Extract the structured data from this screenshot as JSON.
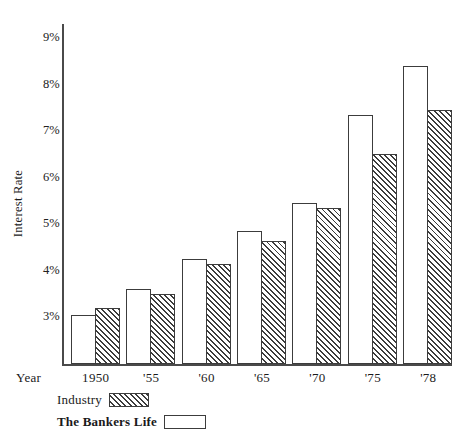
{
  "chart_data": {
    "type": "bar",
    "title": "",
    "subtitle": "",
    "xlabel": "Year",
    "ylabel": "Interest Rate",
    "categories": [
      "1950",
      "'55",
      "'60",
      "'65",
      "'70",
      "'75",
      "'78"
    ],
    "series": [
      {
        "name": "The Bankers Life",
        "style": "open",
        "values": [
          3.05,
          3.6,
          4.25,
          4.85,
          5.45,
          7.35,
          8.4
        ]
      },
      {
        "name": "Industry",
        "style": "hatched",
        "values": [
          3.2,
          3.5,
          4.15,
          4.65,
          5.35,
          6.5,
          7.45
        ]
      }
    ],
    "ylim": [
      2.0,
      9.3
    ],
    "y_ticks": [
      {
        "value": 9,
        "label": "9%"
      },
      {
        "value": 8,
        "label": "8%"
      },
      {
        "value": 7,
        "label": "7%"
      },
      {
        "value": 6,
        "label": "6%"
      },
      {
        "value": 5,
        "label": "5%"
      },
      {
        "value": 4,
        "label": "4%"
      },
      {
        "value": 3,
        "label": "3%"
      }
    ],
    "grid": false,
    "legend_position": "bottom-left",
    "legend": [
      {
        "label": "Industry",
        "swatch": "hatched"
      },
      {
        "label": "The Bankers Life",
        "swatch": "open"
      }
    ],
    "colors": {
      "axis": "#4a4a4a",
      "bar_outline": "#3c3c3c",
      "bar_fill_open": "#ffffff",
      "hatch": "#3c3c3c",
      "background": "#ffffff",
      "text": "#1a1a1a"
    }
  }
}
